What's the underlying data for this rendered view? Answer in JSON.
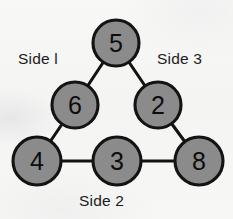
{
  "diagram": {
    "background_color": "#f6f6f5",
    "node_fill_color": "#8b8b8b",
    "node_stroke_color": "#131313",
    "edge_color": "#131313",
    "text_color": "#1b1b1b",
    "node_radius": 23,
    "nodes": [
      {
        "id": "apex",
        "label": "5",
        "cx": 116,
        "cy": 43,
        "r": 23
      },
      {
        "id": "left-middle",
        "label": "6",
        "cx": 75,
        "cy": 105,
        "r": 23
      },
      {
        "id": "right-middle",
        "label": "2",
        "cx": 158,
        "cy": 105,
        "r": 23
      },
      {
        "id": "bottom-left",
        "label": "4",
        "cx": 37,
        "cy": 161,
        "r": 24
      },
      {
        "id": "bottom-mid",
        "label": "3",
        "cx": 117,
        "cy": 161,
        "r": 24
      },
      {
        "id": "bottom-right",
        "label": "8",
        "cx": 199,
        "cy": 161,
        "r": 24
      }
    ],
    "edges": [
      {
        "from": "apex",
        "to": "left-middle"
      },
      {
        "from": "apex",
        "to": "right-middle"
      },
      {
        "from": "left-middle",
        "to": "bottom-left"
      },
      {
        "from": "right-middle",
        "to": "bottom-right"
      },
      {
        "from": "bottom-left",
        "to": "bottom-mid"
      },
      {
        "from": "bottom-mid",
        "to": "bottom-right"
      }
    ],
    "labels": {
      "side1": "Side  l",
      "side2": "Side 2",
      "side3": "Side 3"
    }
  }
}
